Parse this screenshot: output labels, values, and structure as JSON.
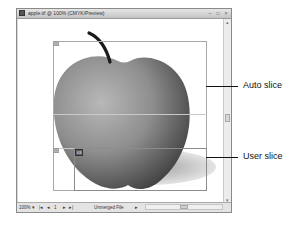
{
  "window": {
    "title": "apple.tif @ 100% (CMYK/Preview)",
    "controls": [
      "minimize",
      "maximize",
      "close"
    ]
  },
  "canvas": {
    "slices": [
      {
        "id": "01",
        "type": "auto"
      },
      {
        "id": "02",
        "type": "auto"
      },
      {
        "id": "03",
        "type": "user"
      }
    ]
  },
  "statusbar": {
    "zoom": "100%",
    "zoom_arrow": "▾",
    "nav_first": "|◂",
    "nav_prev": "◂",
    "page": "1",
    "nav_next": "▸",
    "nav_last": "▸|",
    "info": "Unmerged File",
    "info_arrow": "▸"
  },
  "callouts": {
    "auto_slice": "Auto slice",
    "user_slice": "User slice"
  },
  "colors": {
    "frame": "#8a8a8a",
    "slice_line": "#a9a9a9",
    "user_tag": "#5c5c5c"
  }
}
